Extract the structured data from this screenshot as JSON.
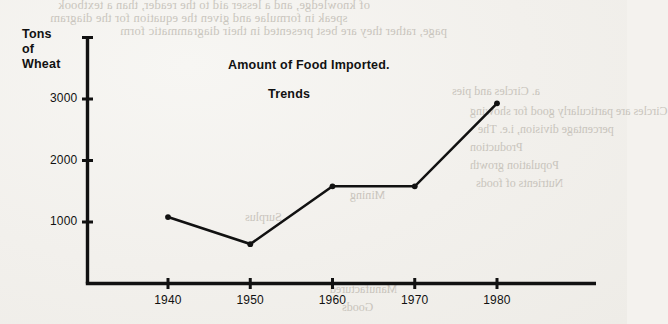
{
  "chart_data": {
    "type": "line",
    "title": "Amount of Food Imported.",
    "subtitle": "Trends",
    "xlabel": "",
    "ylabel": "Tons of Wheat",
    "ylabel_lines": [
      "Tons",
      "of",
      "Wheat"
    ],
    "x": [
      1940,
      1950,
      1960,
      1970,
      1980
    ],
    "values": [
      1080,
      640,
      1580,
      1580,
      2930
    ],
    "categories": [
      "1940",
      "1950",
      "1960",
      "1970",
      "1980"
    ],
    "xticks": [
      "1940",
      "1950",
      "1960",
      "1970",
      "1980"
    ],
    "yticks": [
      "1000",
      "2000",
      "3000"
    ],
    "ytick_values": [
      1000,
      2000,
      3000
    ],
    "unlabeled_ytick_values": [
      4000
    ],
    "xlim": [
      1933,
      1988
    ],
    "ylim": [
      0,
      4250
    ],
    "grid": false,
    "legend": null,
    "marker": "dot",
    "line_color": "#111111",
    "background_color": "#f2f0ec"
  },
  "bleedthrough": {
    "lines": [
      "of knowledge, and a lesser aid to the reader, than a textbook",
      "speak in formulae and given the equation for the diagram",
      "page, rather they are best presented in their diagrammatic form",
      "a.  Circles and pies",
      "Circles are particularly good for showing",
      "percentage division, i.e. The",
      "Production",
      "Population growth",
      "Nutrients of foods",
      "Surplus",
      "Mining",
      "Manufactured",
      "Goods"
    ]
  }
}
